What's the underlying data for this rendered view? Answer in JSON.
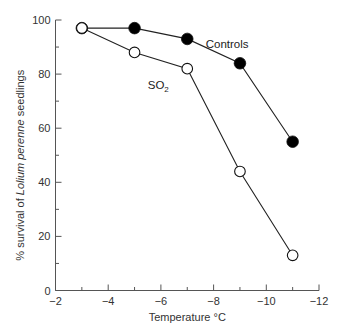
{
  "chart_data": {
    "type": "line",
    "title": "",
    "xlabel": "Temperature °C",
    "ylabel_prefix": "% survival of ",
    "ylabel_italic": "Lolium perenne",
    "ylabel_suffix": " seedlings",
    "xlim": [
      -2,
      -12
    ],
    "ylim": [
      0,
      100
    ],
    "x_major_ticks": [
      -2,
      -4,
      -6,
      -8,
      -10,
      -12
    ],
    "x_tick_labels": [
      "−2",
      "−4",
      "−6",
      "−8",
      "−10",
      "−12"
    ],
    "x_minor_ticks": [
      -3,
      -5,
      -7,
      -9,
      -11
    ],
    "y_major_ticks": [
      0,
      20,
      40,
      60,
      80,
      100
    ],
    "y_tick_labels": [
      "0",
      "20",
      "40",
      "60",
      "80",
      "100"
    ],
    "y_minor_ticks": [
      10,
      30,
      50,
      70,
      90
    ],
    "grid": false,
    "series": [
      {
        "name": "Controls",
        "marker": "filled-circle",
        "x": [
          -3,
          -5,
          -7,
          -9,
          -11
        ],
        "y": [
          97,
          97,
          93,
          84,
          55
        ],
        "label": "Controls"
      },
      {
        "name": "SO2",
        "marker": "open-circle",
        "x": [
          -3,
          -5,
          -7,
          -9,
          -11
        ],
        "y": [
          97,
          88,
          82,
          44,
          13
        ],
        "label_main": "SO",
        "label_sub": "2"
      }
    ]
  }
}
